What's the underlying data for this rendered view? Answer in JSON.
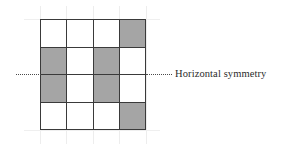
{
  "figure": {
    "background_color": "#ffffff"
  },
  "grid": {
    "rows": 4,
    "columns": 4,
    "line_color": "#3a3a3a",
    "shaded_color": "#a5a5a5",
    "empty_color": "#ffffff",
    "cells": [
      [
        "empty",
        "empty",
        "empty",
        "shaded"
      ],
      [
        "shaded",
        "empty",
        "shaded",
        "empty"
      ],
      [
        "shaded",
        "empty",
        "shaded",
        "empty"
      ],
      [
        "empty",
        "empty",
        "empty",
        "shaded"
      ]
    ]
  },
  "symmetry_axis": {
    "label": "Horizontal symmetry",
    "style": "dotted",
    "color": "#4a4a4a",
    "position": "between row 2 and row 3"
  },
  "guides": {
    "color": "#ededed",
    "vertical_count": 5,
    "horizontal_count": 2
  }
}
